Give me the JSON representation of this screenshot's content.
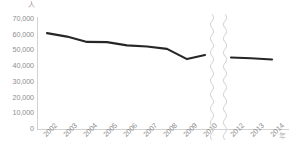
{
  "chart_data": {
    "type": "line",
    "title": "",
    "subtitle": "",
    "xlabel": "年",
    "ylabel": "人",
    "ylim": [
      0,
      70000
    ],
    "ytick_labels": [
      "70,000",
      "60,000",
      "50,000",
      "40,000",
      "30,000",
      "20,000",
      "10,000",
      "0"
    ],
    "ytick_values": [
      70000,
      60000,
      50000,
      40000,
      30000,
      20000,
      10000,
      0
    ],
    "categories": [
      "2002",
      "2003",
      "2004",
      "2005",
      "2006",
      "2007",
      "2008",
      "2009",
      "2010",
      "2012",
      "2013",
      "2014"
    ],
    "axis_break": {
      "present": true,
      "style": "wavy",
      "between": [
        "2010",
        "2012"
      ],
      "color": "#d8d8d8"
    },
    "grid": false,
    "legend": false,
    "legend_position": "none",
    "series": [
      {
        "name": "人数",
        "color": "#262626",
        "values": [
          61000,
          58800,
          55400,
          55300,
          53200,
          52500,
          51000,
          44500,
          47000,
          45500,
          45000,
          44200
        ],
        "segments": [
          {
            "name": "segment-left",
            "categories": [
              "2002",
              "2003",
              "2004",
              "2005",
              "2006",
              "2007",
              "2008",
              "2009",
              "2010"
            ],
            "values": [
              61000,
              58800,
              55400,
              55300,
              53200,
              52500,
              51000,
              44500,
              47000
            ]
          },
          {
            "name": "segment-right",
            "categories": [
              "2012",
              "2013",
              "2014"
            ],
            "values": [
              45500,
              45000,
              44200
            ]
          }
        ]
      }
    ]
  },
  "axes": {
    "y_unit_label": "人",
    "x_unit_label": "年",
    "axis_color": "#d2d2d2",
    "tick_text_color": "#8d8d8d"
  }
}
